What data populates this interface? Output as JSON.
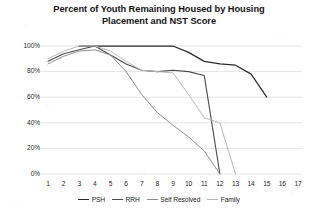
{
  "chart_data": {
    "type": "line",
    "title": "Percent of Youth Remaining Housed by Housing Placement and NST Score",
    "title_line1": "Percent of Youth Remaining Housed by Housing",
    "title_line2": "Placement and NST Score",
    "xlabel": "",
    "ylabel": "",
    "x": [
      1,
      2,
      3,
      4,
      5,
      6,
      7,
      8,
      9,
      10,
      11,
      12,
      13,
      14,
      15,
      16,
      17
    ],
    "xtick_labels": [
      "1",
      "2",
      "3",
      "4",
      "5",
      "6",
      "7",
      "8",
      "9",
      "10",
      "11",
      "12",
      "13",
      "14",
      "15",
      "16",
      "17"
    ],
    "ytick_labels": [
      "0%",
      "20%",
      "40%",
      "60%",
      "80%",
      "100%"
    ],
    "ytick_values": [
      0,
      20,
      40,
      60,
      80,
      100
    ],
    "ylim": [
      0,
      100
    ],
    "xlim": [
      1,
      17
    ],
    "grid": "horizontal",
    "legend_position": "bottom",
    "series": [
      {
        "name": "PSH",
        "color": "#2b2b2b",
        "width": 1.25,
        "x": [
          3,
          4,
          5,
          6,
          7,
          8,
          9,
          10,
          11,
          12,
          13,
          14,
          15
        ],
        "values": [
          100,
          100,
          100,
          100,
          100,
          100,
          100,
          95,
          88,
          86,
          85,
          78,
          60
        ]
      },
      {
        "name": "RRH",
        "color": "#4a4a4a",
        "width": 1.1,
        "x": [
          1,
          2,
          3,
          4,
          5,
          6,
          7,
          8,
          9,
          10,
          11,
          12
        ],
        "values": [
          88,
          94,
          97,
          100,
          93,
          86,
          81,
          80,
          81,
          80,
          77,
          0
        ]
      },
      {
        "name": "Self Resolved",
        "color": "#8e8e8e",
        "width": 1.0,
        "x": [
          1,
          2,
          3,
          4,
          5,
          6,
          7,
          8,
          9,
          10,
          11,
          12
        ],
        "values": [
          86,
          92,
          96,
          97,
          93,
          80,
          62,
          48,
          38,
          29,
          18,
          0
        ]
      },
      {
        "name": "Family",
        "color": "#b9b9b9",
        "width": 1.0,
        "x": [
          1,
          2,
          3,
          4,
          5,
          6,
          7,
          8,
          9,
          10,
          11,
          12,
          13
        ],
        "values": [
          90,
          96,
          100,
          100,
          96,
          88,
          81,
          80,
          79,
          62,
          44,
          40,
          0
        ]
      }
    ]
  },
  "legend": {
    "items": [
      {
        "label": "PSH",
        "color": "#2b2b2b"
      },
      {
        "label": "RRH",
        "color": "#4a4a4a"
      },
      {
        "label": "Self Resolved",
        "color": "#8e8e8e"
      },
      {
        "label": "Family",
        "color": "#b9b9b9"
      }
    ]
  },
  "axes": {
    "gridline_color": "#d8d8d8"
  }
}
